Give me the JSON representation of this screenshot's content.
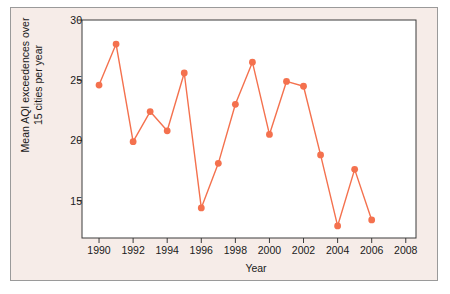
{
  "figure": {
    "background_color": "#f6ece8",
    "border_color": "#9a9a9a",
    "plot_background_color": "#ffffff"
  },
  "chart_data": {
    "type": "line",
    "title": "",
    "xlabel": "Year",
    "ylabel": "Mean AQI exceedences over 15 cities per year",
    "ylabel_line1": "Mean AQI exceedences over",
    "ylabel_line2": "15 cities per year",
    "x": [
      1990,
      1991,
      1992,
      1993,
      1994,
      1995,
      1996,
      1997,
      1998,
      1999,
      2000,
      2001,
      2002,
      2003,
      2004,
      2005,
      2006
    ],
    "values": [
      24.6,
      28.0,
      19.9,
      22.4,
      20.8,
      25.6,
      14.4,
      18.1,
      23.0,
      26.5,
      20.5,
      24.9,
      24.5,
      18.8,
      12.9,
      17.6,
      13.4
    ],
    "series": [
      {
        "name": "Mean AQI exceedences",
        "color": "#f4714e",
        "marker": "circle",
        "values": [
          24.6,
          28.0,
          19.9,
          22.4,
          20.8,
          25.6,
          14.4,
          18.1,
          23.0,
          26.5,
          20.5,
          24.9,
          24.5,
          18.8,
          12.9,
          17.6,
          13.4
        ]
      }
    ],
    "xlim": [
      1989,
      2008.6
    ],
    "ylim": [
      11.9,
      30.0
    ],
    "xticks": [
      1990,
      1992,
      1994,
      1996,
      1998,
      2000,
      2002,
      2004,
      2006,
      2008
    ],
    "xtick_labels": [
      "1990",
      "1992",
      "1994",
      "1996",
      "1998",
      "2000",
      "2002",
      "2004",
      "2006",
      "2008"
    ],
    "yticks": [
      15,
      20,
      25,
      30
    ],
    "ytick_labels": [
      "15",
      "20",
      "25",
      "30"
    ],
    "grid": false,
    "legend": null,
    "line_color": "#f4714e",
    "marker_color": "#f4714e"
  }
}
